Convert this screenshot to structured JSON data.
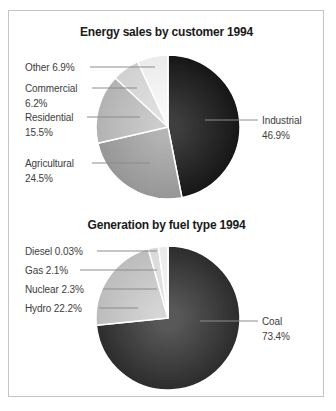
{
  "page": {
    "background": "#ffffff",
    "card_border_color": "#c4c4c4",
    "leader_line_color": "#8c8c8c",
    "label_text_color": "#3d3d3d",
    "title_text_color": "#1a1a1a"
  },
  "chart_data": [
    {
      "type": "pie",
      "title": "Energy sales by customer 1994",
      "unit": "%",
      "start_angle_deg": 0,
      "direction": "clockwise",
      "legend": "none",
      "label_style": "callouts-with-leader-lines",
      "categories": [
        "Industrial",
        "Agricultural",
        "Residential",
        "Commercial",
        "Other"
      ],
      "values": [
        46.9,
        24.5,
        15.5,
        6.2,
        6.9
      ],
      "pct_labels": [
        "46.9",
        "24.5",
        "15.5",
        "6.2",
        "6.9"
      ],
      "callout_texts": [
        "Industrial 46.9%",
        "Agricultural 24.5%",
        "Residential 15.5%",
        "Commercial 6.2%",
        "Other 6.9%"
      ],
      "colors": [
        {
          "inner": "#3e3e3e",
          "outer": "#161616"
        },
        {
          "inner": "#b4b4b4",
          "outer": "#969696"
        },
        {
          "inner": "#cccccc",
          "outer": "#b2b2b2"
        },
        {
          "inner": "#e2e2e2",
          "outer": "#d0d0d0"
        },
        {
          "inner": "#fafafa",
          "outer": "#ebebeb"
        }
      ],
      "slice_separator_color": "#ffffff"
    },
    {
      "type": "pie",
      "title": "Generation by fuel type 1994",
      "unit": "%",
      "start_angle_deg": 0,
      "direction": "clockwise",
      "legend": "none",
      "label_style": "callouts-with-leader-lines",
      "categories": [
        "Coal",
        "Hydro",
        "Nuclear",
        "Gas",
        "Diesel"
      ],
      "values": [
        73.4,
        22.2,
        2.3,
        2.1,
        0.03
      ],
      "pct_labels": [
        "73.4",
        "22.2",
        "2.3",
        "2.1",
        "0.03"
      ],
      "callout_texts": [
        "Coal 73.4%",
        "Hydro 22.2%",
        "Nuclear 2.3%",
        "Gas 2.1%",
        "Diesel 0.03%"
      ],
      "colors": [
        {
          "inner": "#585858",
          "outer": "#2c2c2c"
        },
        {
          "inner": "#d6d6d6",
          "outer": "#bcbcbc"
        },
        {
          "inner": "#e6e6e6",
          "outer": "#d8d8d8"
        },
        {
          "inner": "#f4f4f4",
          "outer": "#eaeaea"
        },
        {
          "inner": "#ffffff",
          "outer": "#f2f2f2"
        }
      ],
      "slice_separator_color": "#ffffff"
    }
  ]
}
